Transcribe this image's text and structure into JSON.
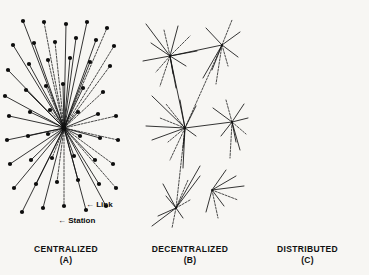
{
  "figure": {
    "background_color": "#f7f6f3",
    "ink_color": "#111111",
    "node_color": "#0d0d0d",
    "width": 369,
    "height": 275
  },
  "annotations": {
    "link": "← Link",
    "station": "← Station",
    "link_label": "Link",
    "station_label": "Station",
    "arrow_glyph": "←"
  },
  "panels": [
    {
      "id": "centralized",
      "name": "CENTRALIZED",
      "letter": "(A)",
      "topology": "star",
      "hub_count": 1
    },
    {
      "id": "decentralized",
      "name": "DECENTRALIZED",
      "letter": "(B)",
      "topology": "hierarchical-multi-hub",
      "hub_count": 5
    },
    {
      "id": "distributed",
      "name": "DISTRIBUTED",
      "letter": "(C)",
      "topology": "mesh",
      "hub_count": 0
    }
  ],
  "chart_data": {
    "type": "diagram",
    "node_radius": 2.1,
    "graphs": [
      {
        "id": "centralized",
        "label": "CENTRALIZED",
        "sublabel": "(A)",
        "hubs": [
          [
            64,
            128
          ]
        ],
        "nodes": [
          [
            64,
            128
          ],
          [
            23,
            21
          ],
          [
            44,
            22
          ],
          [
            66,
            24
          ],
          [
            87,
            22
          ],
          [
            107,
            28
          ],
          [
            13,
            45
          ],
          [
            34,
            43
          ],
          [
            55,
            42
          ],
          [
            76,
            38
          ],
          [
            96,
            40
          ],
          [
            114,
            46
          ],
          [
            8,
            70
          ],
          [
            29,
            64
          ],
          [
            48,
            60
          ],
          [
            70,
            58
          ],
          [
            90,
            62
          ],
          [
            110,
            66
          ],
          [
            5,
            96
          ],
          [
            26,
            90
          ],
          [
            46,
            86
          ],
          [
            63,
            84
          ],
          [
            83,
            88
          ],
          [
            103,
            92
          ],
          [
            9,
            116
          ],
          [
            30,
            112
          ],
          [
            50,
            110
          ],
          [
            78,
            112
          ],
          [
            98,
            114
          ],
          [
            116,
            116
          ],
          [
            7,
            140
          ],
          [
            28,
            136
          ],
          [
            48,
            134
          ],
          [
            80,
            136
          ],
          [
            100,
            138
          ],
          [
            118,
            140
          ],
          [
            10,
            164
          ],
          [
            31,
            160
          ],
          [
            52,
            158
          ],
          [
            74,
            156
          ],
          [
            95,
            160
          ],
          [
            113,
            164
          ],
          [
            14,
            188
          ],
          [
            36,
            184
          ],
          [
            57,
            182
          ],
          [
            78,
            180
          ],
          [
            99,
            184
          ],
          [
            116,
            188
          ],
          [
            22,
            212
          ],
          [
            43,
            208
          ],
          [
            64,
            206
          ],
          [
            86,
            210
          ],
          [
            106,
            206
          ]
        ],
        "edges_from_hub": true
      },
      {
        "id": "decentralized",
        "label": "DECENTRALIZED",
        "sublabel": "(B)",
        "hubs": [
          [
            170,
            56
          ],
          [
            222,
            45
          ],
          [
            185,
            128
          ],
          [
            232,
            122
          ],
          [
            176,
            208
          ],
          [
            212,
            190
          ]
        ],
        "nodes": [
          [
            170,
            56
          ],
          [
            222,
            45
          ],
          [
            185,
            128
          ],
          [
            232,
            122
          ],
          [
            176,
            208
          ],
          [
            212,
            190
          ],
          [
            146,
            24
          ],
          [
            164,
            30
          ],
          [
            178,
            26
          ],
          [
            151,
            43
          ],
          [
            190,
            36
          ],
          [
            197,
            51
          ],
          [
            143,
            61
          ],
          [
            156,
            72
          ],
          [
            173,
            74
          ],
          [
            186,
            66
          ],
          [
            160,
            86
          ],
          [
            176,
            88
          ],
          [
            206,
            28
          ],
          [
            232,
            20
          ],
          [
            240,
            32
          ],
          [
            238,
            57
          ],
          [
            228,
            66
          ],
          [
            212,
            70
          ],
          [
            203,
            78
          ],
          [
            216,
            84
          ],
          [
            152,
            96
          ],
          [
            166,
            104
          ],
          [
            180,
            100
          ],
          [
            196,
            106
          ],
          [
            160,
            118
          ],
          [
            146,
            126
          ],
          [
            152,
            140
          ],
          [
            168,
            142
          ],
          [
            183,
            148
          ],
          [
            196,
            136
          ],
          [
            170,
            160
          ],
          [
            183,
            168
          ],
          [
            213,
            108
          ],
          [
            226,
            100
          ],
          [
            244,
            104
          ],
          [
            248,
            118
          ],
          [
            246,
            134
          ],
          [
            236,
            142
          ],
          [
            221,
            136
          ],
          [
            230,
            158
          ],
          [
            240,
            150
          ],
          [
            150,
            178
          ],
          [
            163,
            184
          ],
          [
            188,
            180
          ],
          [
            200,
            176
          ],
          [
            166,
            196
          ],
          [
            190,
            200
          ],
          [
            158,
            216
          ],
          [
            183,
            218
          ],
          [
            172,
            228
          ],
          [
            152,
            226
          ],
          [
            200,
            166
          ],
          [
            226,
            170
          ],
          [
            236,
            176
          ],
          [
            238,
            200
          ],
          [
            224,
            206
          ],
          [
            206,
            212
          ],
          [
            218,
            218
          ],
          [
            244,
            186
          ]
        ],
        "edges": [
          [
            0,
            6
          ],
          [
            0,
            7
          ],
          [
            0,
            8
          ],
          [
            0,
            9
          ],
          [
            0,
            10
          ],
          [
            0,
            11
          ],
          [
            0,
            12
          ],
          [
            0,
            13
          ],
          [
            0,
            14
          ],
          [
            0,
            15
          ],
          [
            0,
            16
          ],
          [
            0,
            17
          ],
          [
            1,
            18
          ],
          [
            1,
            19
          ],
          [
            1,
            20
          ],
          [
            1,
            21
          ],
          [
            1,
            22
          ],
          [
            1,
            23
          ],
          [
            1,
            24
          ],
          [
            1,
            25
          ],
          [
            0,
            1
          ],
          [
            2,
            26
          ],
          [
            2,
            27
          ],
          [
            2,
            28
          ],
          [
            2,
            29
          ],
          [
            2,
            30
          ],
          [
            2,
            31
          ],
          [
            2,
            32
          ],
          [
            2,
            33
          ],
          [
            2,
            34
          ],
          [
            2,
            35
          ],
          [
            2,
            36
          ],
          [
            2,
            37
          ],
          [
            2,
            0
          ],
          [
            2,
            1
          ],
          [
            2,
            3
          ],
          [
            3,
            38
          ],
          [
            3,
            39
          ],
          [
            3,
            40
          ],
          [
            3,
            41
          ],
          [
            3,
            42
          ],
          [
            3,
            43
          ],
          [
            3,
            44
          ],
          [
            3,
            45
          ],
          [
            3,
            46
          ],
          [
            4,
            48
          ],
          [
            4,
            49
          ],
          [
            4,
            50
          ],
          [
            4,
            51
          ],
          [
            4,
            52
          ],
          [
            4,
            53
          ],
          [
            4,
            54
          ],
          [
            4,
            55
          ],
          [
            4,
            56
          ],
          [
            4,
            57
          ],
          [
            2,
            4
          ],
          [
            5,
            58
          ],
          [
            5,
            59
          ],
          [
            5,
            60
          ],
          [
            5,
            61
          ],
          [
            5,
            62
          ],
          [
            5,
            63
          ],
          [
            5,
            64
          ],
          [
            5,
            65
          ],
          [
            2,
            5
          ],
          [
            3,
            5
          ]
        ]
      },
      {
        "id": "distributed",
        "label": "DISTRIBUTED",
        "sublabel": "(C)",
        "hubs": [],
        "nodes": [
          [
            264,
            26
          ],
          [
            300,
            20
          ],
          [
            338,
            18
          ],
          [
            256,
            38
          ],
          [
            282,
            30
          ],
          [
            312,
            32
          ],
          [
            330,
            40
          ],
          [
            250,
            54
          ],
          [
            272,
            48
          ],
          [
            296,
            44
          ],
          [
            320,
            52
          ],
          [
            344,
            48
          ],
          [
            252,
            72
          ],
          [
            274,
            66
          ],
          [
            298,
            62
          ],
          [
            318,
            70
          ],
          [
            340,
            66
          ],
          [
            256,
            90
          ],
          [
            278,
            84
          ],
          [
            300,
            80
          ],
          [
            322,
            88
          ],
          [
            344,
            84
          ],
          [
            254,
            108
          ],
          [
            276,
            100
          ],
          [
            300,
            98
          ],
          [
            324,
            104
          ],
          [
            346,
            100
          ],
          [
            258,
            126
          ],
          [
            280,
            118
          ],
          [
            302,
            116
          ],
          [
            326,
            122
          ],
          [
            348,
            118
          ],
          [
            256,
            144
          ],
          [
            278,
            138
          ],
          [
            300,
            134
          ],
          [
            324,
            140
          ],
          [
            346,
            136
          ],
          [
            260,
            162
          ],
          [
            282,
            154
          ],
          [
            304,
            152
          ],
          [
            328,
            158
          ],
          [
            348,
            154
          ],
          [
            258,
            180
          ],
          [
            280,
            174
          ],
          [
            302,
            170
          ],
          [
            326,
            176
          ],
          [
            346,
            172
          ],
          [
            262,
            198
          ],
          [
            284,
            190
          ],
          [
            306,
            188
          ],
          [
            330,
            194
          ],
          [
            348,
            190
          ],
          [
            268,
            216
          ],
          [
            290,
            208
          ],
          [
            312,
            206
          ],
          [
            336,
            212
          ],
          [
            350,
            206
          ],
          [
            276,
            230
          ],
          [
            300,
            226
          ],
          [
            324,
            228
          ]
        ],
        "mesh": true
      }
    ]
  }
}
